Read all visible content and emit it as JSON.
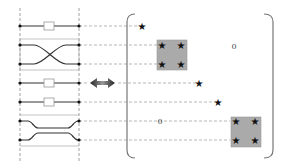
{
  "diagram": {
    "colors": {
      "line": "#333333",
      "dash": "#999999",
      "block_fill": "#aaaaaa",
      "block_stroke": "#888888",
      "star": "#111111",
      "arrow": "#666666"
    },
    "circuit": {
      "modes": 7,
      "elements": [
        {
          "type": "phase-shifter",
          "rows": [
            0
          ]
        },
        {
          "type": "beam-splitter-crossing",
          "rows": [
            1,
            2
          ]
        },
        {
          "type": "phase-shifter",
          "rows": [
            3
          ]
        },
        {
          "type": "phase-shifter",
          "rows": [
            4
          ]
        },
        {
          "type": "directional-coupler",
          "rows": [
            5,
            6
          ]
        }
      ]
    },
    "arrow": {
      "type": "double-headed",
      "meaning": "equivalence"
    },
    "matrix": {
      "zero_labels": [
        "0",
        "0"
      ],
      "diagonal_entries": [
        {
          "type": "single-star",
          "row": 0
        },
        {
          "type": "2x2-block",
          "rows": [
            1,
            2
          ]
        },
        {
          "type": "single-star",
          "row": 3
        },
        {
          "type": "single-star",
          "row": 4
        },
        {
          "type": "2x2-block",
          "rows": [
            5,
            6
          ]
        }
      ],
      "star_symbol": "★"
    }
  }
}
